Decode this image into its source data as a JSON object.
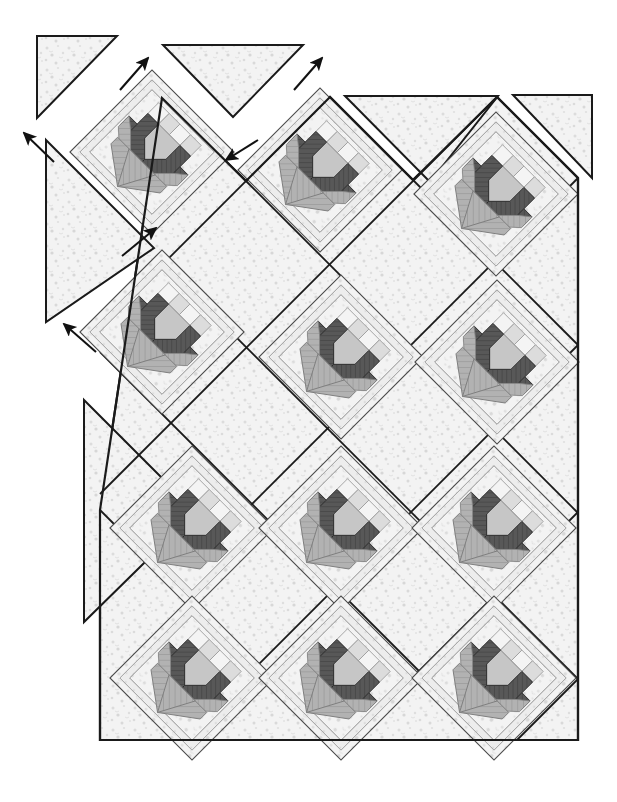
{
  "document": {
    "title": "Quilt Assembly Diagram",
    "type": "diagram",
    "subject": "On-point tulip / flower-basket quilt top assembly",
    "background_color": "#ffffff"
  },
  "palette": {
    "outline": "#1a1a1a",
    "outline_light": "#555555",
    "background_fabric": "#f2f2f2",
    "background_fabric_speckle": "#d8d8d8",
    "petal_dark": "#4f4f4f",
    "petal_mid": "#9a9a9a",
    "petal_light": "#c9c9c9",
    "stem_gray": "#a8a8a8",
    "basket_gray": "#b0b0b0",
    "sashing_white": "#ffffff",
    "checker_light": "#ececec",
    "checker_mid": "#cfcfcf"
  },
  "geometry": {
    "canvas_width": 617,
    "canvas_height": 802,
    "block_half_diagonal": 82,
    "row_pitch_x": 168,
    "row_pitch_y": 168,
    "row_offset_x": 84,
    "row_offset_y": 84,
    "quilt_body_left": 100,
    "quilt_body_right": 578,
    "quilt_body_bottom": 740
  },
  "blocks": {
    "label": "Tulip block set on point",
    "count": 10,
    "centers": [
      {
        "id": "block-r1-c1",
        "x": 152,
        "y": 152,
        "row": 1,
        "col": 1
      },
      {
        "id": "block-r1-c2",
        "x": 320,
        "y": 168,
        "row": 1,
        "col": 2
      },
      {
        "id": "block-r1-c3",
        "x": 496,
        "y": 194,
        "row": 1,
        "col": 3
      },
      {
        "id": "block-r2-c1",
        "x": 162,
        "y": 332,
        "row": 2,
        "col": 1
      },
      {
        "id": "block-r2-c2",
        "x": 340,
        "y": 356,
        "row": 2,
        "col": 2
      },
      {
        "id": "block-r2-c3",
        "x": 496,
        "y": 362,
        "row": 2,
        "col": 3
      },
      {
        "id": "block-r3-c1",
        "x": 192,
        "y": 528,
        "row": 3,
        "col": 1
      },
      {
        "id": "block-r3-c2",
        "x": 340,
        "y": 528,
        "row": 3,
        "col": 2
      },
      {
        "id": "block-r3-c3",
        "x": 494,
        "y": 528,
        "row": 3,
        "col": 3
      },
      {
        "id": "block-r4-c1",
        "x": 192,
        "y": 678,
        "row": 4,
        "col": 1
      },
      {
        "id": "block-r4-c2",
        "x": 340,
        "y": 678,
        "row": 4,
        "col": 2
      },
      {
        "id": "block-r4-c3",
        "x": 494,
        "y": 678,
        "row": 4,
        "col": 3
      }
    ]
  },
  "setting_triangles": {
    "label": "Side and corner setting triangles",
    "pieces": [
      {
        "id": "corner-triangle-top-left",
        "points": "37,36 117,36 37,118"
      },
      {
        "id": "side-triangle-upper-left",
        "points": "44,140 152,248 44,320"
      },
      {
        "id": "side-triangle-top-middle",
        "points": "160,48 300,48 228,120"
      },
      {
        "id": "corner-triangle-top-right",
        "points": "513,95 592,95 592,178"
      },
      {
        "id": "side-triangle-left-lower",
        "points": "84,398 196,510 84,620"
      }
    ]
  },
  "arrows": {
    "label": "Assembly direction arrows",
    "items": [
      {
        "id": "arrow-1",
        "x1": 52,
        "y1": 160,
        "x2": 18,
        "y2": 128,
        "direction": "up-left"
      },
      {
        "id": "arrow-2",
        "x1": 122,
        "y1": 88,
        "x2": 148,
        "y2": 56,
        "direction": "up-right"
      },
      {
        "id": "arrow-3",
        "x1": 296,
        "y1": 88,
        "x2": 322,
        "y2": 58,
        "direction": "up-right"
      },
      {
        "id": "arrow-4",
        "x1": 258,
        "y1": 140,
        "x2": 226,
        "y2": 160,
        "direction": "down-left"
      },
      {
        "id": "arrow-5",
        "x1": 122,
        "y1": 256,
        "x2": 156,
        "y2": 228,
        "direction": "up-right"
      },
      {
        "id": "arrow-6",
        "x1": 96,
        "y1": 352,
        "x2": 62,
        "y2": 322,
        "direction": "up-left"
      }
    ]
  },
  "legend": {
    "fabrics": [
      {
        "name": "background print",
        "swatch": "#f2f2f2"
      },
      {
        "name": "dark tulip petal",
        "swatch": "#4f4f4f"
      },
      {
        "name": "medium tulip petal",
        "swatch": "#9a9a9a"
      },
      {
        "name": "light tulip petal",
        "swatch": "#c9c9c9"
      },
      {
        "name": "basket / stem",
        "swatch": "#b0b0b0"
      },
      {
        "name": "white sashing",
        "swatch": "#ffffff"
      }
    ]
  }
}
